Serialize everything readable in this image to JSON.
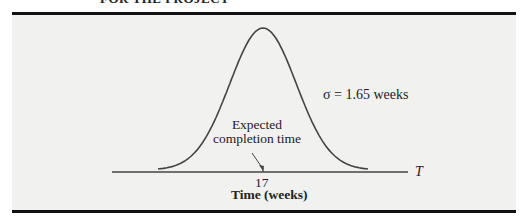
{
  "header": {
    "text": "FOR THE PROJECT"
  },
  "chart_data": {
    "type": "line",
    "title": "",
    "distribution": "normal",
    "mean": 17,
    "sigma": 1.65,
    "xlabel": "Time (weeks)",
    "ylabel": "",
    "axis_name": "T",
    "tick_labels": [
      "17"
    ],
    "annotations": [
      {
        "text": "σ = 1.65 weeks",
        "position": "right of curve"
      },
      {
        "text": "Expected completion time",
        "points_to": 17
      }
    ],
    "grid": false,
    "legend": null
  },
  "labels": {
    "sigma": "σ = 1.65 weeks",
    "annotation_line1": "Expected",
    "annotation_line2": "completion time",
    "tick": "17",
    "xlabel": "Time (weeks)",
    "axis_name": "T"
  }
}
